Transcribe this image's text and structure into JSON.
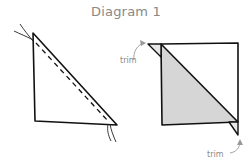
{
  "title": "Diagram 1",
  "left_figure": {
    "description": "Half-square triangle with dashed sewing line along diagonal edge; thread ends at both corners"
  },
  "right_figure": {
    "description": "Pieced square with diagonal seam; lower-left triangle shaded grey; dog-ear tips to trim",
    "labels": {
      "trim_top": "trim",
      "trim_bottom": "trim"
    },
    "fill_color": "#d6d6d6"
  },
  "colors": {
    "line": "#111111",
    "annotation": "#8a8a8a"
  }
}
